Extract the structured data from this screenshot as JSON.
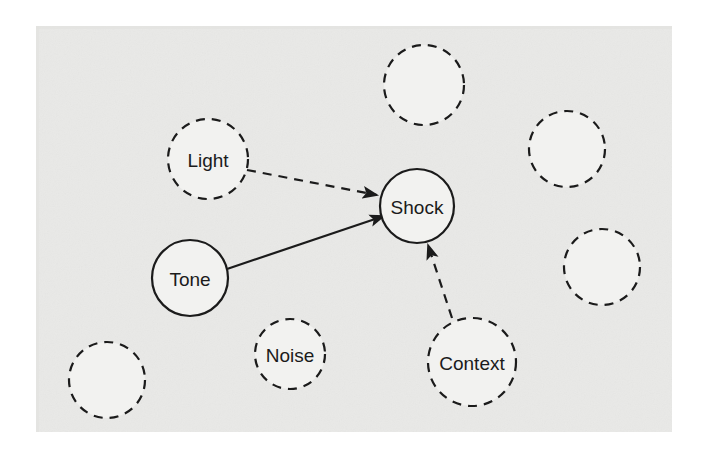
{
  "figure": {
    "plate": {
      "x": 36,
      "y": 26,
      "width": 636,
      "height": 406,
      "background_color": "#e9e9e7",
      "page_background_color": "#ffffff"
    },
    "style": {
      "solid_stroke_color": "#1b1b1b",
      "dashed_stroke_color": "#1b1b1b",
      "node_fill_color": "#f2f2f0",
      "label_color": "#1b1b1b",
      "solid_stroke_width": 2.2,
      "dashed_stroke_width": 2.2,
      "dash_pattern": "9 7",
      "label_font_size": 19
    },
    "nodes": [
      {
        "id": "light",
        "label": "Light",
        "cx": 208,
        "cy": 159,
        "r": 40,
        "border": "dashed",
        "has_label": true
      },
      {
        "id": "shock",
        "label": "Shock",
        "cx": 417,
        "cy": 206,
        "r": 37,
        "border": "solid",
        "has_label": true
      },
      {
        "id": "tone",
        "label": "Tone",
        "cx": 190,
        "cy": 278,
        "r": 38,
        "border": "solid",
        "has_label": true
      },
      {
        "id": "noise",
        "label": "Noise",
        "cx": 290,
        "cy": 354,
        "r": 35,
        "border": "dashed",
        "has_label": true
      },
      {
        "id": "context",
        "label": "Context",
        "cx": 472,
        "cy": 362,
        "r": 44,
        "border": "dashed",
        "has_label": true
      },
      {
        "id": "empty-top",
        "label": "",
        "cx": 424,
        "cy": 85,
        "r": 40,
        "border": "dashed",
        "has_label": false
      },
      {
        "id": "empty-right-upper",
        "label": "",
        "cx": 567,
        "cy": 149,
        "r": 38,
        "border": "dashed",
        "has_label": false
      },
      {
        "id": "empty-right-lower",
        "label": "",
        "cx": 602,
        "cy": 267,
        "r": 38,
        "border": "dashed",
        "has_label": false
      },
      {
        "id": "empty-bottom-left",
        "label": "",
        "cx": 107,
        "cy": 380,
        "r": 38,
        "border": "dashed",
        "has_label": false
      }
    ],
    "edges": [
      {
        "id": "light-to-shock",
        "from": "light",
        "to": "shock",
        "style": "dashed",
        "arrowhead": true,
        "x1": 247,
        "y1": 170,
        "x2": 377,
        "y2": 195
      },
      {
        "id": "tone-to-shock",
        "from": "tone",
        "to": "shock",
        "style": "solid",
        "arrowhead": true,
        "x1": 227,
        "y1": 269,
        "x2": 384,
        "y2": 216
      },
      {
        "id": "context-to-shock",
        "from": "context",
        "to": "shock",
        "style": "dashed",
        "arrowhead": true,
        "x1": 452,
        "y1": 318,
        "x2": 428,
        "y2": 245
      }
    ]
  }
}
